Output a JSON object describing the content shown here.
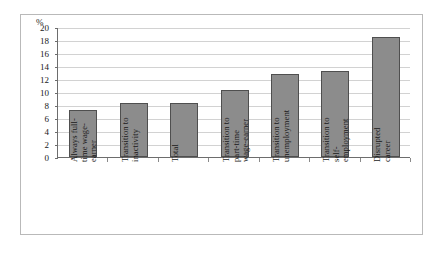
{
  "chart_data": {
    "type": "bar",
    "title": "",
    "subtitle": "",
    "xlabel": "",
    "ylabel": "%",
    "ylim": [
      0,
      20
    ],
    "ytick_step": 2,
    "yticks": [
      "20",
      "18",
      "16",
      "14",
      "12",
      "10",
      "8",
      "6",
      "4",
      "2",
      "0"
    ],
    "grid": true,
    "legend": "none",
    "bar_color": "#8c8c8c",
    "bar_edge_color": "#4f4f4f",
    "categories": [
      "Always full-\ntime wage-\nearner",
      "Transition to\ninactivity",
      "Total",
      "Transition to\npart-time\nwage-earner",
      "Transition to\nunemployment",
      "Transition to\nself-\nemployment",
      "Disrupted\ncareer"
    ],
    "values": [
      7.3,
      8.3,
      8.3,
      10.3,
      12.8,
      13.3,
      18.4
    ]
  }
}
